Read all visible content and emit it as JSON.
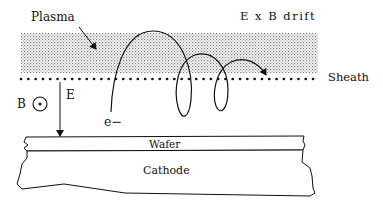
{
  "labels": {
    "plasma": "Plasma",
    "drift": "E x B drift",
    "sheath": "Sheath",
    "b_field": "B",
    "e_field": "E",
    "electron": "e−",
    "wafer": "Wafer",
    "cathode": "Cathode"
  },
  "icons": {
    "b_field_symbol": "circle-dot (field out of page)"
  },
  "colors": {
    "ink": "#111111",
    "background": "#ffffff",
    "plasma_stipple": "#8a8a8a"
  }
}
